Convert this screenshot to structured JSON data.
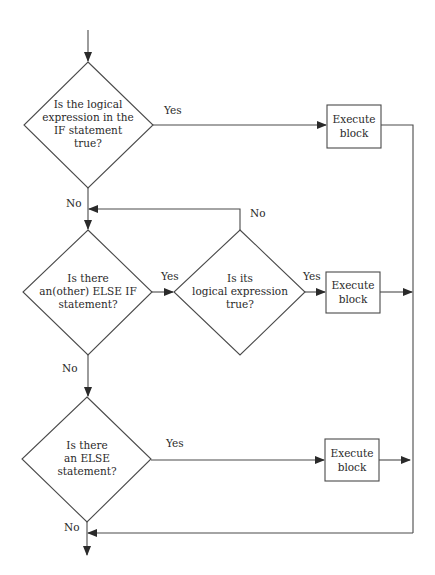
{
  "diagram": {
    "type": "flowchart",
    "colors": {
      "stroke": "#4a4a4a",
      "text": "#2a2a2a",
      "background": "#ffffff"
    },
    "decisions": [
      {
        "id": "d1",
        "lines": [
          "Is the logical",
          "expression in the",
          "IF statement",
          "true?"
        ]
      },
      {
        "id": "d2",
        "lines": [
          "Is there",
          "an(other) ELSE IF",
          "statement?"
        ]
      },
      {
        "id": "d3",
        "lines": [
          "Is its",
          "logical expression",
          "true?"
        ]
      },
      {
        "id": "d4",
        "lines": [
          "Is there",
          "an ELSE",
          "statement?"
        ]
      }
    ],
    "processes": [
      {
        "id": "p1",
        "lines": [
          "Execute",
          "block"
        ]
      },
      {
        "id": "p2",
        "lines": [
          "Execute",
          "block"
        ]
      },
      {
        "id": "p3",
        "lines": [
          "Execute",
          "block"
        ]
      }
    ],
    "edge_labels": {
      "d1_yes": "Yes",
      "d1_no": "No",
      "d3_no": "No",
      "d2_yes": "Yes",
      "d3_yes": "Yes",
      "d2_no": "No",
      "d4_yes": "Yes",
      "d4_no": "No"
    },
    "edges": [
      {
        "from": "start",
        "to": "d1"
      },
      {
        "from": "d1",
        "to": "p1",
        "label": "Yes"
      },
      {
        "from": "d1",
        "to": "d2",
        "label": "No"
      },
      {
        "from": "d2",
        "to": "d3",
        "label": "Yes"
      },
      {
        "from": "d3",
        "to": "d2",
        "label": "No"
      },
      {
        "from": "d3",
        "to": "p2",
        "label": "Yes"
      },
      {
        "from": "d2",
        "to": "d4",
        "label": "No"
      },
      {
        "from": "d4",
        "to": "p3",
        "label": "Yes"
      },
      {
        "from": "d4",
        "to": "end",
        "label": "No"
      },
      {
        "from": "p1",
        "to": "end"
      },
      {
        "from": "p2",
        "to": "end"
      },
      {
        "from": "p3",
        "to": "end"
      }
    ]
  }
}
